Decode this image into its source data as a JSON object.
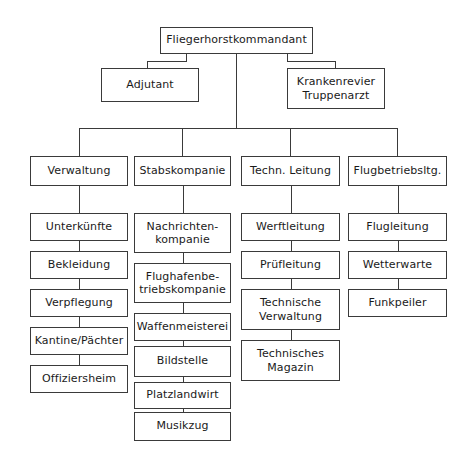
{
  "diagram": {
    "type": "organizational-chart",
    "background_color": "#ffffff",
    "line_color": "#3a3a3a",
    "box_fill_color": "#ffffff"
  },
  "nodes": {
    "root": {
      "label": "Fliegerhorstkommandant",
      "x": 160,
      "y": 27,
      "w": 153,
      "h": 27
    },
    "adjutant": {
      "label": "Adjutant",
      "x": 101,
      "y": 68,
      "w": 98,
      "h": 34
    },
    "krankenrevier": {
      "label": "Krankenrevier\nTruppenarzt",
      "x": 287,
      "y": 68,
      "w": 98,
      "h": 41
    },
    "col1_head": {
      "label": "Verwaltung",
      "x": 30,
      "y": 156,
      "w": 98,
      "h": 30
    },
    "col2_head": {
      "label": "Stabskompanie",
      "x": 134,
      "y": 156,
      "w": 97,
      "h": 30
    },
    "col3_head": {
      "label": "Techn. Leitung",
      "x": 241,
      "y": 156,
      "w": 99,
      "h": 30
    },
    "col4_head": {
      "label": "Flugbetriebsltg.",
      "x": 348,
      "y": 156,
      "w": 99,
      "h": 30
    }
  },
  "columns": [
    {
      "name": "verwaltung",
      "head_key": "col1_head",
      "x": 30,
      "w": 98,
      "items": [
        {
          "label": "Unterkünfte",
          "y": 213,
          "h": 28
        },
        {
          "label": "Bekleidung",
          "y": 251,
          "h": 28
        },
        {
          "label": "Verpflegung",
          "y": 289,
          "h": 28
        },
        {
          "label": "Kantine/Pächter",
          "y": 327,
          "h": 28
        },
        {
          "label": "Offiziersheim",
          "y": 365,
          "h": 28
        }
      ]
    },
    {
      "name": "stabskompanie",
      "head_key": "col2_head",
      "x": 134,
      "w": 97,
      "items": [
        {
          "label": "Nachrichten-\nkompanie",
          "y": 213,
          "h": 40,
          "two_line": true
        },
        {
          "label": "Flughafenbe-\ntriebskompanie",
          "y": 263,
          "h": 40,
          "two_line": true
        },
        {
          "label": "Waffenmeisterei",
          "y": 313,
          "h": 28
        },
        {
          "label": "Bildstelle",
          "y": 346,
          "h": 31
        },
        {
          "label": "Platzlandwirt",
          "y": 382,
          "h": 27
        },
        {
          "label": "Musikzug",
          "y": 412,
          "h": 29
        }
      ]
    },
    {
      "name": "techn-leitung",
      "head_key": "col3_head",
      "x": 241,
      "w": 99,
      "items": [
        {
          "label": "Werftleitung",
          "y": 213,
          "h": 28
        },
        {
          "label": "Prüfleitung",
          "y": 251,
          "h": 28
        },
        {
          "label": "Technische\nVerwaltung",
          "y": 289,
          "h": 41,
          "two_line": true
        },
        {
          "label": "Technisches\nMagazin",
          "y": 340,
          "h": 41,
          "two_line": true
        }
      ]
    },
    {
      "name": "flugbetriebsleitung",
      "head_key": "col4_head",
      "x": 348,
      "w": 99,
      "items": [
        {
          "label": "Flugleitung",
          "y": 213,
          "h": 28
        },
        {
          "label": "Wetterwarte",
          "y": 251,
          "h": 28
        },
        {
          "label": "Funkpeiler",
          "y": 289,
          "h": 28
        }
      ]
    }
  ],
  "connectors": [
    {
      "name": "root-down-left-stub",
      "type": "v",
      "x": 186,
      "y": 54,
      "len": 8
    },
    {
      "name": "root-left-bar",
      "type": "h",
      "x": 147,
      "y": 61,
      "len": 40
    },
    {
      "name": "adjutant-drop",
      "type": "v",
      "x": 147,
      "y": 61,
      "len": 8
    },
    {
      "name": "root-down-right-stub",
      "type": "v",
      "x": 287,
      "y": 54,
      "len": 8
    },
    {
      "name": "root-right-bar",
      "type": "h",
      "x": 287,
      "y": 61,
      "len": 49
    },
    {
      "name": "krankenrevier-drop",
      "type": "v",
      "x": 335,
      "y": 61,
      "len": 8
    },
    {
      "name": "root-main-trunk",
      "type": "v",
      "x": 236,
      "y": 54,
      "len": 75
    },
    {
      "name": "distribution-bar",
      "type": "h",
      "x": 79,
      "y": 128,
      "len": 319
    },
    {
      "name": "drop-col1",
      "type": "v",
      "x": 79,
      "y": 128,
      "len": 29
    },
    {
      "name": "drop-col2",
      "type": "v",
      "x": 182,
      "y": 128,
      "len": 29
    },
    {
      "name": "drop-col3",
      "type": "v",
      "x": 290,
      "y": 128,
      "len": 29
    },
    {
      "name": "drop-col4",
      "type": "v",
      "x": 397,
      "y": 128,
      "len": 29
    }
  ]
}
